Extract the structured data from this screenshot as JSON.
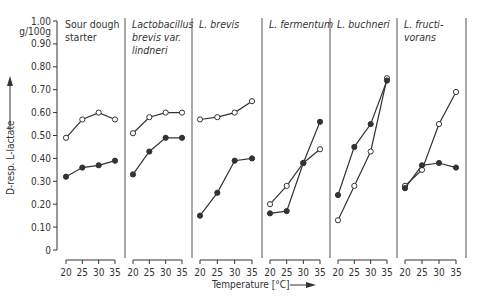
{
  "chart_data": {
    "type": "line",
    "ylabel": "D-resp. L-lactate",
    "yunit": "g/100g",
    "xlabel": "Temperature [°C]",
    "ylim": [
      0,
      1.0
    ],
    "yticks": [
      "0",
      "0.10",
      "0.20",
      "0.30",
      "0.40",
      "0.50",
      "0.60",
      "0.70",
      "0.80",
      "0.90",
      "1.00"
    ],
    "x": [
      20,
      25,
      30,
      35
    ],
    "xticks": [
      "20",
      "25",
      "30",
      "35"
    ],
    "series_legend": {
      "open_circle": "D-lactate (open circles)",
      "filled_circle": "L-lactate (filled circles)"
    },
    "panels": [
      {
        "title": [
          "Sour dough",
          "starter"
        ],
        "italic": false,
        "open": [
          0.49,
          0.57,
          0.6,
          0.57
        ],
        "filled": [
          0.32,
          0.36,
          0.37,
          0.39
        ]
      },
      {
        "title": [
          "Lactobacillus",
          "brevis var.",
          "lindneri"
        ],
        "italic": true,
        "open": [
          0.51,
          0.58,
          0.6,
          0.6
        ],
        "filled": [
          0.33,
          0.43,
          0.49,
          0.49
        ]
      },
      {
        "title": [
          "L. brevis"
        ],
        "italic": true,
        "open": [
          0.57,
          0.58,
          0.6,
          0.65
        ],
        "filled": [
          0.15,
          0.25,
          0.39,
          0.4
        ]
      },
      {
        "title": [
          "L. fermentum"
        ],
        "italic": true,
        "open": [
          0.2,
          0.28,
          0.38,
          0.44
        ],
        "filled": [
          0.16,
          0.17,
          0.38,
          0.56
        ]
      },
      {
        "title": [
          "L. buchneri"
        ],
        "italic": true,
        "open": [
          0.13,
          0.28,
          0.43,
          0.75
        ],
        "filled": [
          0.24,
          0.45,
          0.55,
          0.74
        ]
      },
      {
        "title": [
          "L. fructi-",
          "vorans"
        ],
        "italic": true,
        "open": [
          0.28,
          0.35,
          0.55,
          0.69
        ],
        "filled": [
          0.27,
          0.37,
          0.38,
          0.36
        ]
      }
    ]
  },
  "colors": {
    "line": "#333333",
    "text": "#333333",
    "divider": "#555555"
  }
}
